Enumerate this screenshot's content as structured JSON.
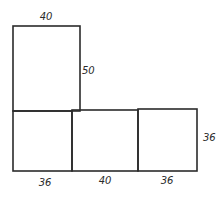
{
  "figure": {
    "stroke_color": "#2b2b2b",
    "background": "#ffffff"
  },
  "labels": {
    "top_face_width": "40",
    "top_face_height": "50",
    "bottom_left_width": "36",
    "bottom_middle_width": "40",
    "bottom_right_width": "36",
    "bottom_row_height": "36"
  }
}
